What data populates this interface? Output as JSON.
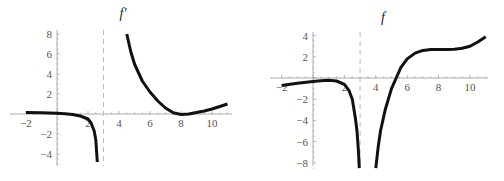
{
  "chart_data": [
    {
      "type": "line",
      "title": "f′",
      "xlabel": "",
      "ylabel": "",
      "xlim": [
        -2.2,
        11.5
      ],
      "ylim": [
        -5,
        8.2
      ],
      "x_ticks": [
        -2,
        2,
        4,
        6,
        8,
        10
      ],
      "x_tick_labels": [
        "−2",
        "2",
        "4",
        "6",
        "8",
        "10"
      ],
      "y_ticks": [
        8,
        6,
        4,
        2,
        -2,
        -4
      ],
      "y_tick_labels": [
        "8",
        "6",
        "4",
        "2",
        "−2",
        "−4"
      ],
      "asymptote_x": 3,
      "grid": false,
      "series": [
        {
          "name": "f′ left branch",
          "points": [
            [
              -2,
              0.15
            ],
            [
              -1,
              0.12
            ],
            [
              0,
              0.08
            ],
            [
              0.5,
              0.03
            ],
            [
              1,
              -0.05
            ],
            [
              1.5,
              -0.2
            ],
            [
              2,
              -0.5
            ],
            [
              2.2,
              -0.9
            ],
            [
              2.4,
              -1.7
            ],
            [
              2.5,
              -2.6
            ],
            [
              2.6,
              -4.8
            ]
          ]
        },
        {
          "name": "f′ right branch",
          "points": [
            [
              4.5,
              8
            ],
            [
              4.75,
              6.3
            ],
            [
              5,
              5
            ],
            [
              5.5,
              3.3
            ],
            [
              6,
              2.2
            ],
            [
              6.5,
              1.3
            ],
            [
              7,
              0.6
            ],
            [
              7.5,
              0.12
            ],
            [
              8,
              -0.05
            ],
            [
              8.5,
              0
            ],
            [
              9,
              0.15
            ],
            [
              9.5,
              0.3
            ],
            [
              10,
              0.5
            ],
            [
              10.5,
              0.75
            ],
            [
              11,
              1.0
            ]
          ]
        }
      ]
    },
    {
      "type": "line",
      "title": "f",
      "xlabel": "",
      "ylabel": "",
      "xlim": [
        -2.2,
        11.5
      ],
      "ylim": [
        -8.5,
        4.2
      ],
      "x_ticks": [
        -2,
        2,
        4,
        6,
        8,
        10
      ],
      "x_tick_labels": [
        "−2",
        "2",
        "4",
        "6",
        "8",
        "10"
      ],
      "y_ticks": [
        4,
        2,
        -2,
        -4,
        -6,
        -8
      ],
      "y_tick_labels": [
        "4",
        "2",
        "−2",
        "−4",
        "−6",
        "−8"
      ],
      "asymptote_x": 3,
      "grid": false,
      "series": [
        {
          "name": "f left branch",
          "points": [
            [
              -2,
              -0.7
            ],
            [
              -1,
              -0.5
            ],
            [
              0,
              -0.32
            ],
            [
              0.5,
              -0.25
            ],
            [
              1,
              -0.22
            ],
            [
              1.5,
              -0.28
            ],
            [
              2,
              -0.6
            ],
            [
              2.3,
              -1.2
            ],
            [
              2.5,
              -2
            ],
            [
              2.7,
              -3.8
            ],
            [
              2.8,
              -5
            ],
            [
              2.9,
              -7
            ],
            [
              2.95,
              -8.5
            ]
          ]
        },
        {
          "name": "f right branch",
          "points": [
            [
              4,
              -8.5
            ],
            [
              4.15,
              -6.5
            ],
            [
              4.3,
              -5
            ],
            [
              4.6,
              -3
            ],
            [
              5,
              -1
            ],
            [
              5.3,
              0
            ],
            [
              5.6,
              1
            ],
            [
              6,
              1.8
            ],
            [
              6.5,
              2.35
            ],
            [
              7,
              2.6
            ],
            [
              7.5,
              2.68
            ],
            [
              8,
              2.7
            ],
            [
              8.5,
              2.7
            ],
            [
              9,
              2.72
            ],
            [
              9.5,
              2.8
            ],
            [
              10,
              3.0
            ],
            [
              10.5,
              3.4
            ],
            [
              11,
              3.9
            ]
          ]
        }
      ]
    }
  ]
}
